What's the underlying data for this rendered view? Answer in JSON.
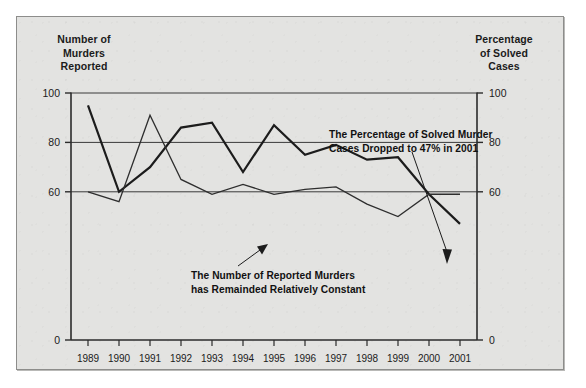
{
  "axis_titles": {
    "left": "Number of\nMurders\nReported",
    "left_lines": [
      "Number of",
      "Murders",
      "Reported"
    ],
    "right_lines": [
      "Percentage",
      "of Solved",
      "Cases"
    ]
  },
  "annotations": {
    "solved": {
      "line1": "The Percentage of Solved Murder",
      "line2": "Cases Dropped to 47% in 2001"
    },
    "reported": {
      "line1": "The Number of Reported Murders",
      "line2": "has Remainded Relatively Constant"
    }
  },
  "colors": {
    "background": "#e3e3e1",
    "frame_border": "#8d8d8b",
    "axis": "#2b2b2b",
    "gridline": "#3a3a3a",
    "series_solved": "#1c1c1c",
    "series_reported": "#2e2e2e",
    "text": "#1b1b1b"
  },
  "chart_data": {
    "type": "line",
    "title": "",
    "xlabel": "",
    "ylabel": "Number of Murders Reported",
    "y2label": "Percentage of Solved Cases",
    "grid": true,
    "legend_position": "none",
    "ylim": [
      0,
      100
    ],
    "y2lim": [
      0,
      100
    ],
    "yticks": [
      0,
      60,
      80,
      100
    ],
    "ytick_labels": [
      "0",
      "60",
      "80",
      "100"
    ],
    "y2ticks": [
      0,
      60,
      80,
      100
    ],
    "y2tick_labels": [
      "0",
      "60",
      "80",
      "100"
    ],
    "x": [
      1989,
      1990,
      1991,
      1992,
      1993,
      1994,
      1995,
      1996,
      1997,
      1998,
      1999,
      2000,
      2001
    ],
    "categories": [
      "1989",
      "1990",
      "1991",
      "1992",
      "1993",
      "1994",
      "1995",
      "1996",
      "1997",
      "1998",
      "1999",
      "2000",
      "2001"
    ],
    "series": [
      {
        "name": "Percentage of Solved Cases",
        "axis": "right",
        "stroke_width": 2.2,
        "values": [
          95,
          60,
          70,
          86,
          88,
          68,
          87,
          75,
          79,
          73,
          74,
          59,
          47
        ]
      },
      {
        "name": "Number of Murders Reported",
        "axis": "left",
        "stroke_width": 1.3,
        "values": [
          60,
          56,
          91,
          65,
          59,
          63,
          59,
          61,
          62,
          55,
          50,
          59,
          59
        ]
      }
    ]
  }
}
